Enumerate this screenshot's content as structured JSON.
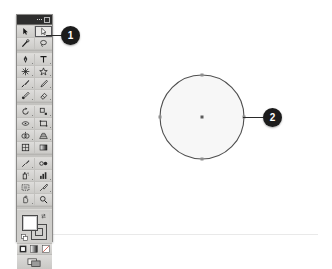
{
  "app": {
    "name": "Illustrator Tools Panel",
    "panel_title": "Tools"
  },
  "toolbar": {
    "title_dots": [
      "dot",
      "dot",
      "dot"
    ],
    "tools": [
      {
        "name": "selection-tool",
        "label": "Selection",
        "icon": "arrow-solid",
        "selected": false,
        "has_flyout": false
      },
      {
        "name": "direct-selection-tool",
        "label": "Direct Selection",
        "icon": "arrow-hollow",
        "selected": true,
        "has_flyout": true
      },
      {
        "name": "magic-wand-tool",
        "label": "Magic Wand",
        "icon": "magic-wand",
        "selected": false,
        "has_flyout": false
      },
      {
        "name": "lasso-tool",
        "label": "Lasso",
        "icon": "lasso",
        "selected": false,
        "has_flyout": false
      },
      {
        "name": "pen-tool",
        "label": "Pen",
        "icon": "pen-nib",
        "selected": false,
        "has_flyout": true
      },
      {
        "name": "type-tool",
        "label": "Type",
        "icon": "letter-t",
        "selected": false,
        "has_flyout": true
      },
      {
        "name": "line-segment-tool",
        "label": "Line Segment",
        "icon": "line-burst",
        "selected": false,
        "has_flyout": true
      },
      {
        "name": "shape-tool",
        "label": "Rectangle",
        "icon": "star-shape",
        "selected": false,
        "has_flyout": true
      },
      {
        "name": "paintbrush-tool",
        "label": "Paintbrush",
        "icon": "paintbrush",
        "selected": false,
        "has_flyout": true
      },
      {
        "name": "pencil-tool",
        "label": "Pencil",
        "icon": "pencil",
        "selected": false,
        "has_flyout": true
      },
      {
        "name": "blob-brush-tool",
        "label": "Blob Brush",
        "icon": "blob-brush",
        "selected": false,
        "has_flyout": true
      },
      {
        "name": "eraser-tool",
        "label": "Eraser",
        "icon": "eraser",
        "selected": false,
        "has_flyout": true
      },
      {
        "name": "rotate-tool",
        "label": "Rotate",
        "icon": "rotate-arrow",
        "selected": false,
        "has_flyout": true
      },
      {
        "name": "scale-tool",
        "label": "Scale",
        "icon": "scale-box",
        "selected": false,
        "has_flyout": true
      },
      {
        "name": "width-tool",
        "label": "Width",
        "icon": "width-shape",
        "selected": false,
        "has_flyout": true
      },
      {
        "name": "free-transform-tool",
        "label": "Free Transform",
        "icon": "transform-box",
        "selected": false,
        "has_flyout": true
      },
      {
        "name": "shape-builder-tool",
        "label": "Shape Builder",
        "icon": "shape-builder",
        "selected": false,
        "has_flyout": true
      },
      {
        "name": "perspective-grid-tool",
        "label": "Perspective Grid",
        "icon": "grid-perspective",
        "selected": false,
        "has_flyout": true
      },
      {
        "name": "mesh-tool",
        "label": "Mesh",
        "icon": "mesh-grid",
        "selected": false,
        "has_flyout": false
      },
      {
        "name": "gradient-tool",
        "label": "Gradient",
        "icon": "gradient-bar",
        "selected": false,
        "has_flyout": false
      },
      {
        "name": "eyedropper-tool",
        "label": "Eyedropper",
        "icon": "eyedropper",
        "selected": false,
        "has_flyout": true
      },
      {
        "name": "blend-tool",
        "label": "Blend",
        "icon": "blend-shapes",
        "selected": false,
        "has_flyout": false
      },
      {
        "name": "symbol-sprayer-tool",
        "label": "Symbol Sprayer",
        "icon": "spray-can",
        "selected": false,
        "has_flyout": true
      },
      {
        "name": "column-graph-tool",
        "label": "Column Graph",
        "icon": "bar-graph",
        "selected": false,
        "has_flyout": true
      },
      {
        "name": "artboard-tool",
        "label": "Artboard",
        "icon": "artboard-frame",
        "selected": false,
        "has_flyout": false
      },
      {
        "name": "slice-tool",
        "label": "Slice",
        "icon": "slice-knife",
        "selected": false,
        "has_flyout": true
      },
      {
        "name": "hand-tool",
        "label": "Hand",
        "icon": "hand",
        "selected": false,
        "has_flyout": true
      },
      {
        "name": "zoom-tool",
        "label": "Zoom",
        "icon": "magnifier",
        "selected": false,
        "has_flyout": false
      }
    ],
    "fill_stroke": {
      "fill_label": "Fill",
      "fill_color": "#ffffff",
      "stroke_label": "Stroke",
      "stroke_color": "#000000",
      "swap_label": "Swap Fill and Stroke",
      "default_label": "Default Fill and Stroke"
    },
    "paint_modes": [
      {
        "name": "color-mode-button",
        "label": "Color"
      },
      {
        "name": "gradient-mode-button",
        "label": "Gradient"
      },
      {
        "name": "none-mode-button",
        "label": "None"
      }
    ],
    "screen_mode": {
      "name": "change-screen-mode-button",
      "label": "Change Screen Mode"
    }
  },
  "canvas": {
    "shape": {
      "name": "ellipse-object",
      "type": "ellipse",
      "center_x": 202,
      "center_y": 117,
      "radius": 42,
      "fill_color": "#f7f7f7",
      "stroke_color": "#4f4f4f",
      "anchor_count": 4,
      "anchors": [
        {
          "label": "top-anchor",
          "x": 202,
          "y": 75
        },
        {
          "label": "right-anchor",
          "x": 244,
          "y": 117
        },
        {
          "label": "bottom-anchor",
          "x": 202,
          "y": 159
        },
        {
          "label": "left-anchor",
          "x": 160,
          "y": 117
        }
      ],
      "center_point_label": "center-point"
    }
  },
  "callouts": [
    {
      "name": "callout-badge-1",
      "number": "1",
      "target": "direct-selection-tool"
    },
    {
      "name": "callout-badge-2",
      "number": "2",
      "target": "ellipse-object"
    }
  ]
}
